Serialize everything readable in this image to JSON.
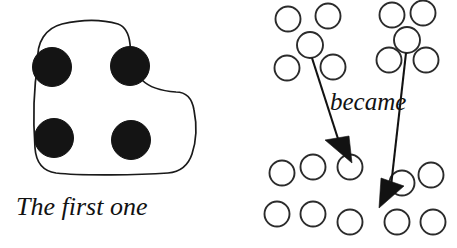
{
  "figure": {
    "canvas": {
      "width": 457,
      "height": 248,
      "background": "#ffffff"
    },
    "ink_color": "#141414",
    "outline_color": "#1a1a1a",
    "open_circle_stroke": "#2b2b2b",
    "left_panel": {
      "caption": "The first one",
      "caption_style": "italic-serif",
      "caption_position": {
        "x": 16,
        "y": 215
      },
      "blob": {
        "shape": "L-shaped rounded hand-drawn enclosure",
        "path": "M 38 62 C 36 42 46 28 62 24 C 84 19 104 20 118 24 C 126 27 129 34 130 44 C 131 58 134 72 142 80 C 150 88 162 91 176 92 C 186 92 192 98 194 110 C 197 125 196 142 192 154 C 188 166 180 172 168 173 C 140 175 82 176 56 173 C 42 171 36 162 35 148 C 33 120 34 86 38 62 Z"
      },
      "discs": [
        {
          "id": "disc-top-left",
          "cx": 52,
          "cy": 67,
          "r": 19.5,
          "fill": "#141414"
        },
        {
          "id": "disc-top-right",
          "cx": 130,
          "cy": 66,
          "r": 19.5,
          "fill": "#141414"
        },
        {
          "id": "disc-bottom-left",
          "cx": 54,
          "cy": 138,
          "r": 19.5,
          "fill": "#141414"
        },
        {
          "id": "disc-bottom-right",
          "cx": 131,
          "cy": 140,
          "r": 19.5,
          "fill": "#141414"
        }
      ],
      "disc_count": 4
    },
    "right_panel": {
      "caption": "became",
      "caption_style": "italic-serif",
      "caption_position": {
        "x": 330,
        "y": 110
      },
      "open_circles": [
        {
          "id": "circle-tl-1",
          "cx": 288,
          "cy": 19,
          "r": 12.5
        },
        {
          "id": "circle-tl-2",
          "cx": 328,
          "cy": 16,
          "r": 12.5
        },
        {
          "id": "circle-tl-3",
          "cx": 310,
          "cy": 45,
          "r": 13.0
        },
        {
          "id": "circle-tl-4",
          "cx": 287,
          "cy": 68,
          "r": 12.5
        },
        {
          "id": "circle-tl-5",
          "cx": 333,
          "cy": 67,
          "r": 12.5
        },
        {
          "id": "circle-tr-1",
          "cx": 392,
          "cy": 15,
          "r": 12.5
        },
        {
          "id": "circle-tr-2",
          "cx": 423,
          "cy": 13,
          "r": 12.5
        },
        {
          "id": "circle-tr-3",
          "cx": 407,
          "cy": 40,
          "r": 13.0
        },
        {
          "id": "circle-tr-4",
          "cx": 389,
          "cy": 60,
          "r": 12.5
        },
        {
          "id": "circle-tr-5",
          "cx": 426,
          "cy": 60,
          "r": 12.5
        },
        {
          "id": "circle-bl-1",
          "cx": 282,
          "cy": 173,
          "r": 12.5
        },
        {
          "id": "circle-bl-2",
          "cx": 313,
          "cy": 167,
          "r": 12.5
        },
        {
          "id": "circle-bm-1",
          "cx": 350,
          "cy": 167,
          "r": 12.5
        },
        {
          "id": "circle-bl-3",
          "cx": 277,
          "cy": 214,
          "r": 12.5
        },
        {
          "id": "circle-bl-4",
          "cx": 313,
          "cy": 214,
          "r": 12.5
        },
        {
          "id": "circle-bm-2",
          "cx": 350,
          "cy": 222,
          "r": 12.5
        },
        {
          "id": "circle-br-1",
          "cx": 402,
          "cy": 183,
          "r": 12.5
        },
        {
          "id": "circle-br-2",
          "cx": 431,
          "cy": 175,
          "r": 12.5
        },
        {
          "id": "circle-br-3",
          "cx": 397,
          "cy": 222,
          "r": 12.5
        },
        {
          "id": "circle-br-4",
          "cx": 433,
          "cy": 222,
          "r": 12.5
        }
      ],
      "open_circle_count": 20,
      "arrows": [
        {
          "id": "arrow-left",
          "from": {
            "x": 312,
            "y": 58
          },
          "to": {
            "x": 352,
            "y": 163
          },
          "head_tip": {
            "x": 352,
            "y": 163
          },
          "head_left": {
            "x": 325,
            "y": 140
          },
          "head_right": {
            "x": 349,
            "y": 136
          },
          "shaft_end": {
            "x": 340,
            "y": 145
          }
        },
        {
          "id": "arrow-right",
          "from": {
            "x": 406,
            "y": 53
          },
          "to": {
            "x": 379,
            "y": 208
          },
          "head_tip": {
            "x": 379,
            "y": 208
          },
          "head_left": {
            "x": 381,
            "y": 178
          },
          "head_right": {
            "x": 404,
            "y": 186
          },
          "shaft_end": {
            "x": 391,
            "y": 186
          }
        }
      ]
    }
  }
}
